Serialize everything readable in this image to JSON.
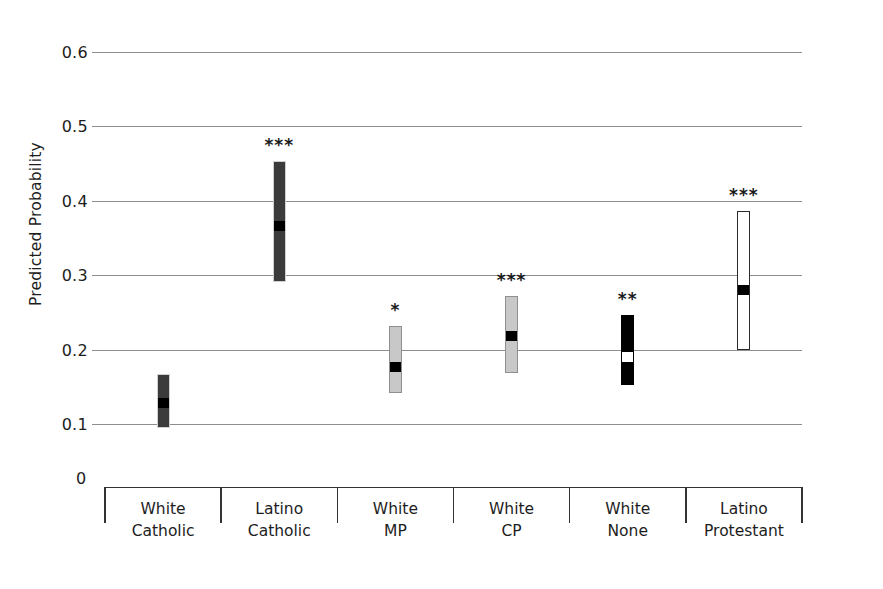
{
  "chart_data": {
    "type": "bar",
    "title": "",
    "subtitle": "",
    "xlabel": "",
    "ylabel": "Predicted Probability",
    "ylim": [
      0.0,
      0.6
    ],
    "yticks": [
      "0.6",
      "0.5",
      "0.4",
      "0.3",
      "0.2",
      "0.1"
    ],
    "ytick_values": [
      0.6,
      0.5,
      0.4,
      0.3,
      0.2,
      0.1
    ],
    "origin_label": "0",
    "grid": "horizontal",
    "legend": "none",
    "categories": [
      "White Catholic",
      "Latino Catholic",
      "White MP",
      "White CP",
      "White None",
      "Latino Protestant"
    ],
    "category_lines": [
      [
        "White",
        "Catholic"
      ],
      [
        "Latino",
        "Catholic"
      ],
      [
        "White",
        "MP"
      ],
      [
        "White",
        "CP"
      ],
      [
        "White",
        "None"
      ],
      [
        "Latino",
        "Protestant"
      ]
    ],
    "values": [
      0.13,
      0.368,
      0.178,
      0.22,
      0.192,
      0.282
    ],
    "ci_low": [
      0.094,
      0.291,
      0.142,
      0.168,
      0.152,
      0.2
    ],
    "ci_high": [
      0.167,
      0.453,
      0.232,
      0.272,
      0.246,
      0.386
    ],
    "significance": [
      "",
      "***",
      "*",
      "***",
      "**",
      "***"
    ],
    "bar_styles": [
      "dark-gray",
      "dark-gray",
      "light-gray",
      "light-gray",
      "black",
      "white-outline"
    ],
    "marker_styles": [
      "black",
      "black",
      "black",
      "black",
      "white",
      "black"
    ],
    "series": [
      {
        "name": "Predicted Probability",
        "points": [
          {
            "category": "White Catholic",
            "value": 0.13,
            "low": 0.094,
            "high": 0.167,
            "significance": ""
          },
          {
            "category": "Latino Catholic",
            "value": 0.368,
            "low": 0.291,
            "high": 0.453,
            "significance": "***"
          },
          {
            "category": "White MP",
            "value": 0.178,
            "low": 0.142,
            "high": 0.232,
            "significance": "*"
          },
          {
            "category": "White CP",
            "value": 0.22,
            "low": 0.168,
            "high": 0.272,
            "significance": "***"
          },
          {
            "category": "White None",
            "value": 0.192,
            "low": 0.152,
            "high": 0.246,
            "significance": "**"
          },
          {
            "category": "Latino Protestant",
            "value": 0.282,
            "low": 0.2,
            "high": 0.386,
            "significance": "***"
          }
        ]
      }
    ],
    "colors": {
      "dark-gray": "#3b3b3b",
      "light-gray": "#c8c8c8",
      "black": "#000000",
      "white-outline": "#ffffff",
      "gridline": "#8e8e8e",
      "axis": "#333333",
      "text": "#1d1d1d"
    }
  }
}
